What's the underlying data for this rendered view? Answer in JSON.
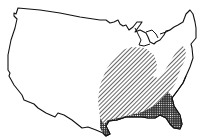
{
  "map": {
    "subject": "Contiguous United States outline",
    "colors": {
      "background": "#ffffff",
      "outline": "#111111",
      "hatch": "#111111"
    },
    "regions": [
      {
        "id": "range-hatched",
        "pattern": "diagonal-hatch",
        "label": "Southeastern range (diagonal hatching)"
      },
      {
        "id": "range-dense",
        "pattern": "dense-stipple",
        "label": "Gulf coast and Florida (dense shading)"
      }
    ]
  }
}
